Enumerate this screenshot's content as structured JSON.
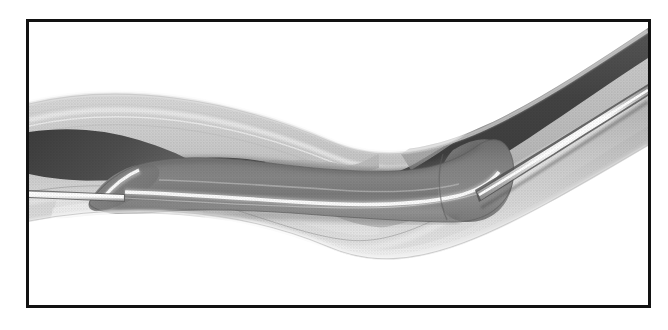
{
  "figure": {
    "domain": "medical-illustration",
    "title": "Balloon angioplasty catheter inflated within a stenosed artery",
    "caption": "",
    "style": "grayscale halftone line-and-tone medical drawing",
    "frame": {
      "border_color": "#121212",
      "border_width_px": 3,
      "background_color": "#ffffff",
      "x": 26,
      "y": 19,
      "width": 625,
      "height": 289
    },
    "palette": {
      "page_background": "#ffffff",
      "frame_border": "#121212",
      "vessel_outer_wall_light": "#d9d9d9",
      "vessel_outer_wall_mid": "#c2c2c2",
      "vessel_media_gray": "#a8a8a8",
      "plaque_light_gray": "#cfcfcf",
      "lumen_dark_gray": "#4a4a4a",
      "lumen_darkest": "#3a3a3a",
      "balloon_body_gray": "#7d7d7d",
      "balloon_shadow_gray": "#646464",
      "balloon_highlight_white": "#fbfbfb",
      "catheter_shaft_white": "#fdfdfd",
      "catheter_outline_dark": "#5a5a5a"
    },
    "structures": [
      {
        "id": "artery-outer-wall",
        "label": "Artery outer wall (adventitia / media)",
        "tone": "light gray",
        "description": "Broad curved band sweeping from upper-left down through the centre and back up to the right edge"
      },
      {
        "id": "atherosclerotic-plaque",
        "label": "Atherosclerotic plaque",
        "tone": "pale gray, scalloped irregular border",
        "description": "Thickened lining narrowing the lumen, visible along the upper and lower inner vessel walls"
      },
      {
        "id": "vessel-lumen",
        "label": "Vessel lumen",
        "tone": "dark gray",
        "description": "Dark channel visible at upper left and upper right of the frame"
      },
      {
        "id": "balloon",
        "label": "Inflated angioplasty balloon",
        "tone": "mid gray with specular white highlight",
        "description": "Elongated cylinder with tapered left tip and rounded right shoulder, spanning the central lumen"
      },
      {
        "id": "catheter-shaft",
        "label": "Catheter shaft / guidewire",
        "tone": "bright white line with dark outline",
        "description": "Thin straight line entering from the left frame edge, passing through the balloon and continuing out the right frame edge"
      }
    ]
  }
}
